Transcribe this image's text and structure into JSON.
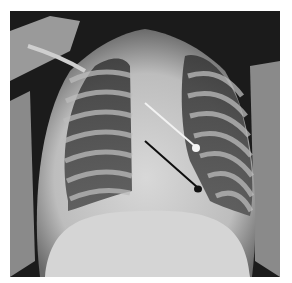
{
  "image": {
    "subject": "Chest radiograph (frontal view, pediatric)",
    "border_color": "#ffffff",
    "background_color": "#1a1a1a",
    "markers": [
      {
        "name": "white-pin",
        "color": "#f0f0f0",
        "head": [
          197,
          148
        ]
      },
      {
        "name": "black-pin",
        "color": "#111111",
        "head": [
          198,
          191
        ]
      }
    ]
  }
}
